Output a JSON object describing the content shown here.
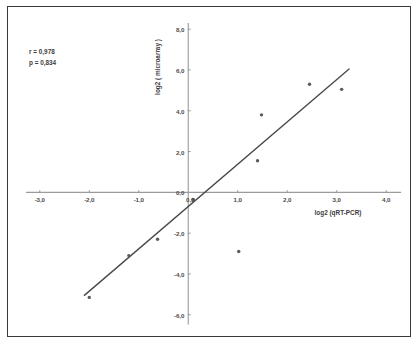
{
  "figure": {
    "background": "#ffffff",
    "frame_color": "#3a3a3a",
    "axis_color": "#9b9b9b",
    "point_color": "#5a5a5a",
    "line_color": "#4a4a4a",
    "text_color": "#3d3d3d"
  },
  "annotations": {
    "r_label": "r = 0,978",
    "p_label": "p = 0,834"
  },
  "chart_data": {
    "type": "scatter",
    "title": "",
    "subtitle": "",
    "xlabel": "log2 (qRT-PCR)",
    "ylabel": "log2 ( microarray )",
    "xlim": [
      -3.4,
      4.4
    ],
    "ylim": [
      -6.6,
      8.4
    ],
    "xticks": [
      -3,
      -2,
      -1,
      0,
      1,
      2,
      3,
      4
    ],
    "yticks": [
      -6,
      -4,
      -2,
      0,
      2,
      4,
      6,
      8
    ],
    "xticklabels": [
      "-3,0",
      "-2,0",
      "-1,0",
      "0,0",
      "1,0",
      "2,0",
      "3,0",
      "4,0"
    ],
    "yticklabels": [
      "-6,0",
      "-4,0",
      "-2,0",
      "0,0",
      "2,0",
      "4,0",
      "6,0",
      "8,0"
    ],
    "grid": false,
    "legend": "none",
    "decimal_separator": ",",
    "points": [
      {
        "x": -2.0,
        "y": -5.15
      },
      {
        "x": -1.2,
        "y": -3.1
      },
      {
        "x": -0.62,
        "y": -2.3
      },
      {
        "x": 0.1,
        "y": -0.35
      },
      {
        "x": 1.02,
        "y": -2.9
      },
      {
        "x": 1.4,
        "y": 1.55
      },
      {
        "x": 1.48,
        "y": 3.8
      },
      {
        "x": 2.45,
        "y": 5.3
      },
      {
        "x": 3.1,
        "y": 5.05
      }
    ],
    "fit_line": {
      "kind": "linear-regression",
      "x_start": -2.1,
      "y_start": -5.05,
      "x_end": 3.25,
      "y_end": 6.05,
      "r": 0.978,
      "p": 0.834
    }
  }
}
